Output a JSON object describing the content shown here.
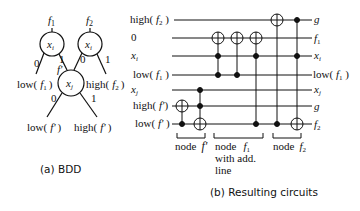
{
  "bdd": {
    "caption": "(a) BDD",
    "nodes": [
      {
        "id": "n1",
        "var": "x",
        "sub": "i",
        "label": "f",
        "label_sub": "1"
      },
      {
        "id": "n2",
        "var": "x",
        "sub": "i",
        "label": "f",
        "label_sub": "2"
      },
      {
        "id": "n3",
        "var": "x",
        "sub": "j",
        "label": "f'",
        "label_sub": ""
      }
    ],
    "edges": [
      {
        "from": "n1",
        "label": "0",
        "to_text": "low( f1 )"
      },
      {
        "from": "n1",
        "label": "1",
        "to": "n3"
      },
      {
        "from": "n2",
        "label": "0",
        "to": "n3"
      },
      {
        "from": "n2",
        "label": "1",
        "to_text": "high( f2 )"
      },
      {
        "from": "n3",
        "label": "0",
        "to_text": "low( f' )"
      },
      {
        "from": "n3",
        "label": "1",
        "to_text": "high( f' )"
      }
    ],
    "texts": {
      "f1_name": "f",
      "f1_sub": "1",
      "f2_name": "f",
      "f2_sub": "2",
      "fprime": "f'",
      "xi": "x",
      "xi_sub": "i",
      "xj": "x",
      "xj_sub": "j",
      "edge0": "0",
      "edge1": "1",
      "low_f1": "low(",
      "high_f2": "high(",
      "low_fp": "low(",
      "high_fp": "high(",
      "close": ")"
    }
  },
  "circuit": {
    "caption": "(b) Resulting circuits",
    "inputs": [
      "high( f2 )",
      "0",
      "xi",
      "low( f1 )",
      "xj",
      "high( f' )",
      "low( f' )"
    ],
    "outputs": [
      "g",
      "f1",
      "xi",
      "low( f1 )",
      "xj",
      "g",
      "f2"
    ],
    "groups": [
      {
        "label": "node  f'"
      },
      {
        "label": "node  f1 with add. line"
      },
      {
        "label": "node  f2"
      }
    ],
    "texts": {
      "node": "node",
      "with_add": "with add.",
      "line": "line",
      "zero": "0",
      "g": "g"
    }
  }
}
